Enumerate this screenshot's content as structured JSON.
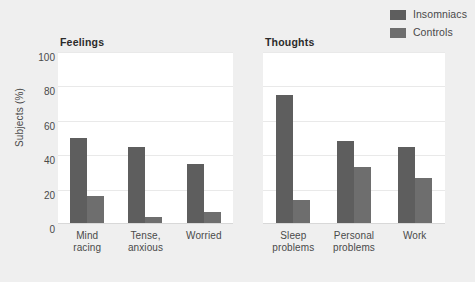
{
  "legend": {
    "items": [
      {
        "label": "Insomniacs",
        "color": "#5e5e5e",
        "icon": "legend-swatch-icon"
      },
      {
        "label": "Controls",
        "color": "#6e6e6e",
        "icon": "legend-swatch-icon"
      }
    ]
  },
  "axis": {
    "ylabel": "Subjects (%)",
    "yticks": [
      "0",
      "20",
      "40",
      "60",
      "80",
      "100"
    ]
  },
  "panels": [
    {
      "title": "Feelings"
    },
    {
      "title": "Thoughts"
    }
  ],
  "colors": {
    "background": "#efefef",
    "plot_area": "#ffffff",
    "insomniacs": "#5e5e5e",
    "controls": "#6e6e6e",
    "gridline": "#e9e9e9",
    "text": "#4a4a4a"
  },
  "chart_data": {
    "type": "bar",
    "title": "",
    "xlabel": "",
    "ylabel": "Subjects (%)",
    "ylim": [
      0,
      100
    ],
    "yticks": [
      0,
      20,
      40,
      60,
      80,
      100
    ],
    "grid": true,
    "legend_position": "top-right",
    "panels": [
      {
        "title": "Feelings",
        "categories": [
          "Mind racing",
          "Tense, anxious",
          "Worried"
        ],
        "category_lines": [
          [
            "Mind",
            "racing"
          ],
          [
            "Tense,",
            "anxious"
          ],
          [
            "Worried",
            ""
          ]
        ],
        "series": [
          {
            "name": "Insomniacs",
            "values": [
              50,
              45,
              35
            ]
          },
          {
            "name": "Controls",
            "values": [
              16,
              4,
              7
            ]
          }
        ]
      },
      {
        "title": "Thoughts",
        "categories": [
          "Sleep problems",
          "Personal problems",
          "Work"
        ],
        "category_lines": [
          [
            "Sleep",
            "problems"
          ],
          [
            "Personal",
            "problems"
          ],
          [
            "Work",
            ""
          ]
        ],
        "series": [
          {
            "name": "Insomniacs",
            "values": [
              75,
              48,
              45
            ]
          },
          {
            "name": "Controls",
            "values": [
              14,
              33,
              27
            ]
          }
        ]
      }
    ]
  }
}
